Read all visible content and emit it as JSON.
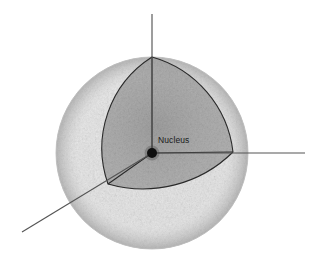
{
  "figure": {
    "background_color": "#ffffff",
    "labels": {
      "nucleus": "Nucleus"
    },
    "colors": {
      "background": "#ffffff",
      "sphere_light": "#f2f2f2",
      "sphere_mid": "#d9d9d9",
      "sphere_edge": "#c4c4c4",
      "cutout_dark": "#9a9a9a",
      "cutout_deep": "#6e6e6e",
      "nucleus_dot": "#101010",
      "axis_line": "#555555",
      "outline": "#2a2a2a",
      "label_text": "#1a1a1a"
    },
    "geometry": {
      "sphere_center_x": 152,
      "sphere_center_y": 153,
      "sphere_radius": 96,
      "nucleus_dot_radius": 5,
      "cutout_apex_top_x": 152,
      "cutout_apex_top_y": 57,
      "cutout_apex_right_x": 233,
      "cutout_apex_right_y": 152,
      "cutout_apex_lowerleft_x": 108,
      "cutout_apex_lowerleft_y": 184,
      "axis_vertical_top_y": 14,
      "axis_horizontal_right_x": 305,
      "axis_diagonal_end_x": 22,
      "axis_diagonal_end_y": 232
    },
    "elements": {
      "sphere_name": "electron-cloud-sphere",
      "cutout_name": "octant-cutaway",
      "axis_vertical_name": "axis-vertical",
      "axis_horizontal_name": "axis-horizontal",
      "axis_diagonal_name": "axis-diagonal"
    }
  }
}
